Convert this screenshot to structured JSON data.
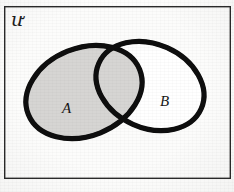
{
  "figure": {
    "kind": "venn-diagram",
    "background_color": "#fdfdfc",
    "frame": {
      "name": "universe-rectangle",
      "stroke_color": "#2a2a2a",
      "stroke_width": 1.4,
      "x": 4,
      "y": 6,
      "width": 226,
      "height": 172
    },
    "universe": {
      "symbol": "ư",
      "label": "U",
      "meaning": "universal-set",
      "x": 11,
      "y": 10
    },
    "shading": {
      "fill_color": "#d6d5d3",
      "shaded_region": "A",
      "description": "Set A including the intersection A and B is shaded grey; the B-only region is unshaded white."
    },
    "stroke": {
      "color": "#0d0d0d",
      "width": 5.2
    },
    "sets": [
      {
        "id": "A",
        "label": "A",
        "name": "left-ellipse",
        "cx": 84,
        "cy": 92,
        "rx": 60,
        "ry": 44,
        "rotation_deg": -22,
        "filled": true,
        "fill_color": "#d6d5d3",
        "label_x": 62,
        "label_y": 101
      },
      {
        "id": "B",
        "label": "B",
        "name": "right-ellipse",
        "cx": 150,
        "cy": 86,
        "rx": 56,
        "ry": 42,
        "rotation_deg": 24,
        "filled": false,
        "fill_color": "#ffffff",
        "label_x": 160,
        "label_y": 94
      }
    ],
    "intersections": [
      {
        "name": "top-crossing-point",
        "x": 116,
        "y": 33
      },
      {
        "name": "bottom-crossing-point",
        "x": 119,
        "y": 126
      }
    ]
  }
}
